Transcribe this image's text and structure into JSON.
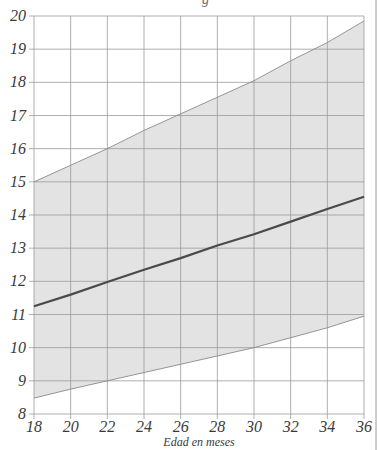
{
  "chart_data": {
    "type": "area",
    "title": "",
    "title_fragment_visible": "g",
    "xlabel": "Edad en meses",
    "ylabel": "",
    "xlim": [
      18,
      36
    ],
    "ylim": [
      8,
      20
    ],
    "x_ticks": [
      18,
      20,
      22,
      24,
      26,
      28,
      30,
      32,
      34,
      36
    ],
    "y_ticks": [
      8,
      9,
      10,
      11,
      12,
      13,
      14,
      15,
      16,
      17,
      18,
      19,
      20
    ],
    "grid": true,
    "legend": null,
    "x": [
      18,
      20,
      22,
      24,
      26,
      28,
      30,
      32,
      34,
      36
    ],
    "series": [
      {
        "name": "Límite superior",
        "kind": "band-upper",
        "values": [
          15.0,
          15.5,
          16.0,
          16.55,
          17.05,
          17.55,
          18.05,
          18.65,
          19.2,
          19.85
        ]
      },
      {
        "name": "Mediana",
        "kind": "line",
        "values": [
          11.25,
          11.6,
          11.98,
          12.35,
          12.7,
          13.08,
          13.42,
          13.8,
          14.18,
          14.55
        ]
      },
      {
        "name": "Límite inferior",
        "kind": "band-lower",
        "values": [
          8.48,
          8.75,
          9.0,
          9.25,
          9.5,
          9.75,
          10.0,
          10.3,
          10.6,
          10.95
        ]
      }
    ],
    "colors": {
      "band_fill": "#e3e3e3",
      "band_edge": "#8a8a8a",
      "median_line": "#4a4a4a",
      "grid": "#9a9a9a",
      "axis": "#555555"
    }
  }
}
